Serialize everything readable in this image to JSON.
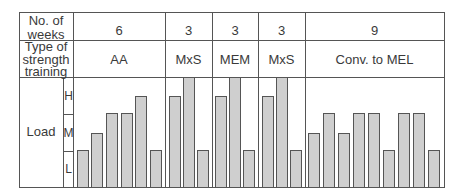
{
  "table": {
    "row_headers": {
      "weeks": [
        "No. of",
        "weeks"
      ],
      "type": [
        "Type of",
        "strength",
        "training"
      ],
      "load": "Load"
    },
    "load_levels": [
      "H",
      "M",
      "L"
    ],
    "phases": [
      {
        "weeks": "6",
        "type": "AA"
      },
      {
        "weeks": "3",
        "type": "MxS"
      },
      {
        "weeks": "3",
        "type": "MEM"
      },
      {
        "weeks": "3",
        "type": "MxS"
      },
      {
        "weeks": "9",
        "type": "Conv. to MEL"
      }
    ]
  },
  "chart_data": {
    "type": "bar",
    "title": "",
    "xlabel": "",
    "ylabel": "Load",
    "y_tick_labels": [
      "L",
      "M",
      "H"
    ],
    "level_scale": {
      "L": 1,
      "M-low": 1.5,
      "M": 2,
      "H": 3,
      "H-peak": 3.5
    },
    "phases": [
      {
        "name": "AA",
        "weeks": 6,
        "values": [
          1,
          1.5,
          2,
          2,
          3,
          1
        ]
      },
      {
        "name": "MxS",
        "weeks": 3,
        "values": [
          3,
          3.5,
          1
        ]
      },
      {
        "name": "MEM",
        "weeks": 3,
        "values": [
          3,
          3.5,
          1
        ]
      },
      {
        "name": "MxS",
        "weeks": 3,
        "values": [
          3,
          3.5,
          1
        ]
      },
      {
        "name": "Conv. to MEL",
        "weeks": 9,
        "values": [
          1.5,
          2,
          1.5,
          2,
          2,
          1,
          2,
          2,
          1
        ]
      }
    ],
    "categories": [
      "w1",
      "w2",
      "w3",
      "w4",
      "w5",
      "w6",
      "w7",
      "w8",
      "w9",
      "w10",
      "w11",
      "w12",
      "w13",
      "w14",
      "w15",
      "w16",
      "w17",
      "w18",
      "w19",
      "w20",
      "w21",
      "w22",
      "w23",
      "w24"
    ],
    "values": [
      1,
      1.5,
      2,
      2,
      3,
      1,
      3,
      3.5,
      1,
      3,
      3.5,
      1,
      3,
      3.5,
      1,
      1.5,
      2,
      1.5,
      2,
      2,
      1,
      2,
      2,
      1
    ],
    "ylim": [
      0,
      3.5
    ],
    "grid": false,
    "colors": {
      "bar_fill": "#cfcfcf",
      "bar_edge": "#555555",
      "grid_lines": "#555555"
    }
  }
}
